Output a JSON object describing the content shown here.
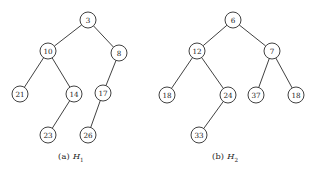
{
  "figure": {
    "background_color": "#ffffff",
    "stroke_color": "#2b2b2b",
    "text_color": "#1a1a1a",
    "node_radius": 8
  },
  "panels": [
    {
      "id": "panel-a",
      "caption_tag": "(a)",
      "caption_name": "H",
      "caption_subscript": "1",
      "chart_data": {
        "type": "diagram",
        "diagram_type": "binary-tree",
        "title": "(a) H1",
        "nodes": [
          {
            "id": "a-3",
            "label": "3",
            "x": 88,
            "y": 20
          },
          {
            "id": "a-10",
            "label": "10",
            "x": 48,
            "y": 51
          },
          {
            "id": "a-8",
            "label": "8",
            "x": 119,
            "y": 53
          },
          {
            "id": "a-21",
            "label": "21",
            "x": 20,
            "y": 94
          },
          {
            "id": "a-14",
            "label": "14",
            "x": 74,
            "y": 94
          },
          {
            "id": "a-17",
            "label": "17",
            "x": 103,
            "y": 93
          },
          {
            "id": "a-23",
            "label": "23",
            "x": 48,
            "y": 135
          },
          {
            "id": "a-26",
            "label": "26",
            "x": 88,
            "y": 135
          }
        ],
        "edges": [
          {
            "from": "a-3",
            "to": "a-10"
          },
          {
            "from": "a-3",
            "to": "a-8"
          },
          {
            "from": "a-10",
            "to": "a-21"
          },
          {
            "from": "a-10",
            "to": "a-14"
          },
          {
            "from": "a-8",
            "to": "a-17"
          },
          {
            "from": "a-14",
            "to": "a-23"
          },
          {
            "from": "a-17",
            "to": "a-26"
          }
        ]
      }
    },
    {
      "id": "panel-b",
      "caption_tag": "(b)",
      "caption_name": "H",
      "caption_subscript": "2",
      "chart_data": {
        "type": "diagram",
        "diagram_type": "binary-tree",
        "title": "(b) H2",
        "nodes": [
          {
            "id": "b-6",
            "label": "6",
            "x": 233,
            "y": 20
          },
          {
            "id": "b-12",
            "label": "12",
            "x": 197,
            "y": 51
          },
          {
            "id": "b-7",
            "label": "7",
            "x": 272,
            "y": 51
          },
          {
            "id": "b-18a",
            "label": "18",
            "x": 167,
            "y": 95
          },
          {
            "id": "b-24",
            "label": "24",
            "x": 228,
            "y": 95
          },
          {
            "id": "b-37",
            "label": "37",
            "x": 256,
            "y": 95
          },
          {
            "id": "b-18b",
            "label": "18",
            "x": 296,
            "y": 95
          },
          {
            "id": "b-33",
            "label": "33",
            "x": 199,
            "y": 135
          }
        ],
        "edges": [
          {
            "from": "b-6",
            "to": "b-12"
          },
          {
            "from": "b-6",
            "to": "b-7"
          },
          {
            "from": "b-12",
            "to": "b-18a"
          },
          {
            "from": "b-12",
            "to": "b-24"
          },
          {
            "from": "b-7",
            "to": "b-37"
          },
          {
            "from": "b-7",
            "to": "b-18b"
          },
          {
            "from": "b-24",
            "to": "b-33"
          }
        ]
      }
    }
  ]
}
